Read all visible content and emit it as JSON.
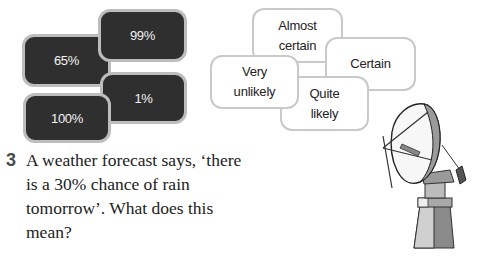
{
  "percent_cards": [
    {
      "label": "99%"
    },
    {
      "label": "65%"
    },
    {
      "label": "1%"
    },
    {
      "label": "100%"
    }
  ],
  "phrase_cards": [
    {
      "line1": "Almost",
      "line2": "certain"
    },
    {
      "line1": "Certain",
      "line2": ""
    },
    {
      "line1": "Very",
      "line2": "unlikely"
    },
    {
      "line1": "Quite",
      "line2": "likely"
    }
  ],
  "question": {
    "number": "3",
    "text": "A weather forecast says, ‘there is a 30% chance of rain tomorrow’. What does this mean?"
  },
  "illustration": {
    "icon": "satellite-dish-icon"
  },
  "colors": {
    "dark_card": "#2f2f2f",
    "dark_card_border": "#bdbdbd",
    "light_card_border": "#c9c9c9",
    "question_number": "#4a4a4a"
  }
}
